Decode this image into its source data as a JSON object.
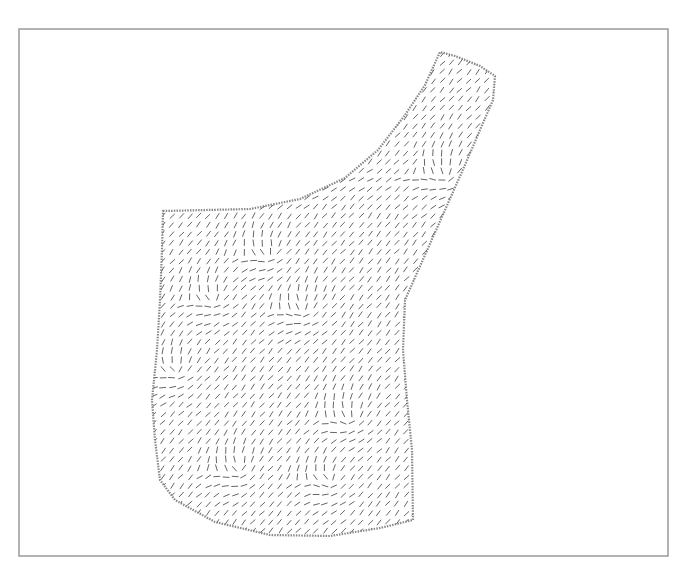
{
  "chart_data": {
    "type": "quiver",
    "title": "",
    "xlabel": "",
    "ylabel": "",
    "grid": false,
    "legend": null,
    "frame": {
      "x": 19,
      "y": 29,
      "width": 649,
      "height": 527,
      "color": "#9a9a9a"
    },
    "arrow_color": "#555555",
    "grid_spacing_px": 9,
    "segment_length_px": 6,
    "dominant_angle_deg": -50,
    "region_outline": [
      [
        163,
        211
      ],
      [
        250,
        209
      ],
      [
        300,
        199
      ],
      [
        345,
        178
      ],
      [
        378,
        150
      ],
      [
        405,
        115
      ],
      [
        425,
        85
      ],
      [
        440,
        52
      ],
      [
        455,
        56
      ],
      [
        480,
        66
      ],
      [
        495,
        76
      ],
      [
        493,
        100
      ],
      [
        480,
        130
      ],
      [
        465,
        165
      ],
      [
        445,
        210
      ],
      [
        425,
        255
      ],
      [
        405,
        300
      ],
      [
        403,
        350
      ],
      [
        407,
        400
      ],
      [
        412,
        450
      ],
      [
        413,
        520
      ],
      [
        380,
        528
      ],
      [
        330,
        536
      ],
      [
        270,
        535
      ],
      [
        215,
        522
      ],
      [
        175,
        500
      ],
      [
        160,
        480
      ],
      [
        155,
        440
      ],
      [
        152,
        400
      ],
      [
        157,
        350
      ],
      [
        160,
        300
      ],
      [
        162,
        250
      ]
    ],
    "singularities": [
      [
        270,
        255
      ],
      [
        215,
        300
      ],
      [
        305,
        310
      ],
      [
        175,
        370
      ],
      [
        350,
        420
      ],
      [
        240,
        470
      ],
      [
        330,
        480
      ],
      [
        445,
        175
      ]
    ]
  }
}
